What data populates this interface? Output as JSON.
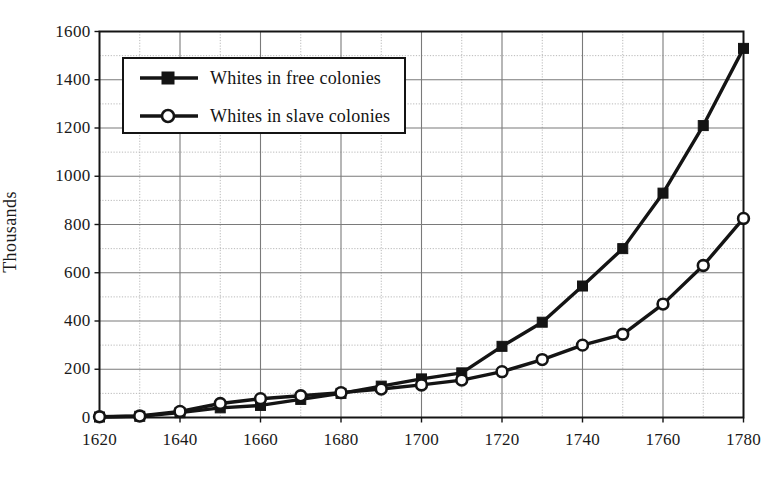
{
  "chart_data": {
    "type": "line",
    "title": "",
    "subtitle": "",
    "xlabel": "",
    "ylabel": "Thousands",
    "xlim": [
      1620,
      1780
    ],
    "ylim": [
      0,
      1600
    ],
    "x": [
      1620,
      1630,
      1640,
      1650,
      1660,
      1670,
      1680,
      1690,
      1700,
      1710,
      1720,
      1730,
      1740,
      1750,
      1760,
      1770,
      1780
    ],
    "categories": [
      "1620",
      "1630",
      "1640",
      "1650",
      "1660",
      "1670",
      "1680",
      "1690",
      "1700",
      "1710",
      "1720",
      "1730",
      "1740",
      "1750",
      "1760",
      "1770",
      "1780"
    ],
    "series": [
      {
        "name": "Whites in free colonies",
        "marker": "filled-square",
        "color": "#141414",
        "values": [
          2,
          5,
          20,
          40,
          50,
          75,
          100,
          130,
          160,
          185,
          295,
          395,
          545,
          700,
          930,
          1210,
          1530
        ]
      },
      {
        "name": "Whites in slave colonies",
        "marker": "open-circle",
        "color": "#141414",
        "values": [
          3,
          6,
          25,
          58,
          78,
          90,
          103,
          118,
          135,
          155,
          190,
          240,
          300,
          345,
          470,
          630,
          825
        ]
      }
    ],
    "xticks_major": [
      1620,
      1640,
      1660,
      1680,
      1700,
      1720,
      1740,
      1760,
      1780
    ],
    "xticks_minor": [
      1630,
      1650,
      1670,
      1690,
      1710,
      1730,
      1750,
      1770
    ],
    "yticks_major": [
      0,
      200,
      400,
      600,
      800,
      1000,
      1200,
      1400,
      1600
    ],
    "yticks_minor": [
      100,
      300,
      500,
      700,
      900,
      1100,
      1300,
      1500
    ],
    "ytick_labels": [
      "0",
      "200",
      "400",
      "600",
      "800",
      "1000",
      "1200",
      "1400",
      "1600"
    ],
    "xtick_labels": [
      "1620",
      "1640",
      "1660",
      "1680",
      "1700",
      "1720",
      "1740",
      "1760",
      "1780"
    ],
    "grid": true,
    "grid_major_color": "#7a7a7a",
    "grid_minor_color": "#b8b8b8",
    "axis_color": "#141414",
    "legend_position": "upper-left",
    "legend_entries": [
      "Whites in free colonies",
      "Whites in slave colonies"
    ]
  }
}
